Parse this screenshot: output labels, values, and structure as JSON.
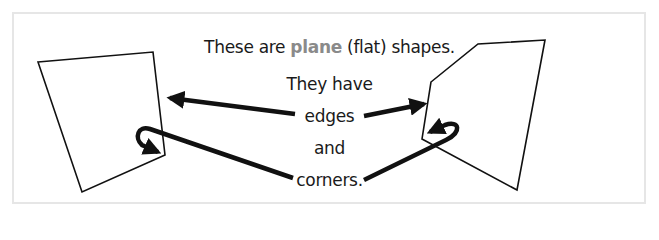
{
  "diagram": {
    "line1": {
      "before": "These are ",
      "highlight": "plane",
      "after": " (flat) shapes."
    },
    "line2": "They have",
    "line3": "edges",
    "line4": "and",
    "line5": "corners.",
    "colors": {
      "text": "#1a1a1a",
      "highlight": "#8a8a8a",
      "frame": "#e6e6e6",
      "stroke": "#111111"
    },
    "shapes": [
      {
        "name": "quadrilateral",
        "points": "38,62 153,52 165,155 82,192"
      },
      {
        "name": "pentagon",
        "points": "431,82 478,44 545,40 517,190 422,139"
      }
    ]
  }
}
